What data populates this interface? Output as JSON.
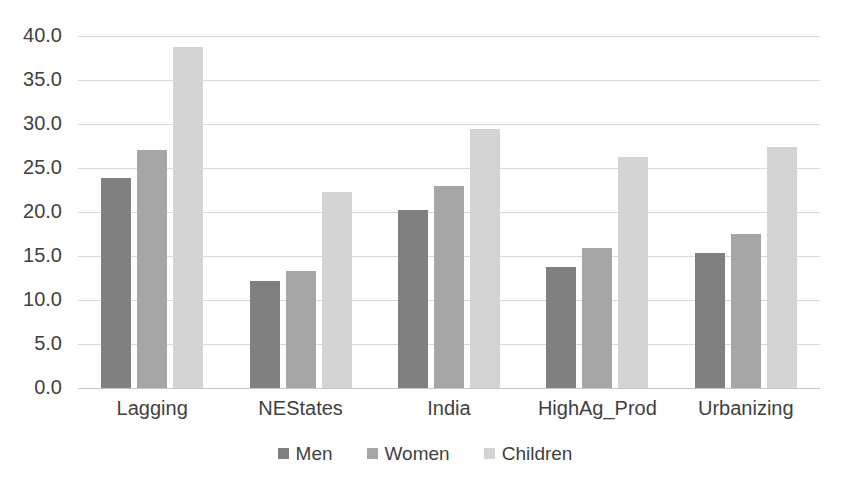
{
  "chart_data": {
    "type": "bar",
    "title": "",
    "subtitle": "",
    "xlabel": "",
    "ylabel": "",
    "categories": [
      "Lagging",
      "NEStates",
      "India",
      "HighAg_Prod",
      "Urbanizing"
    ],
    "series": [
      {
        "name": "Men",
        "color": "#808080",
        "values": [
          23.9,
          12.2,
          20.2,
          13.8,
          15.3
        ]
      },
      {
        "name": "Women",
        "color": "#a6a6a6",
        "values": [
          27.1,
          13.3,
          22.9,
          15.9,
          17.5
        ]
      },
      {
        "name": "Children",
        "color": "#d4d4d4",
        "values": [
          38.8,
          22.3,
          29.4,
          26.2,
          27.4
        ]
      }
    ],
    "ylim": [
      0,
      40
    ],
    "ytick_step": 5,
    "ytick_labels": [
      "0.0",
      "5.0",
      "10.0",
      "15.0",
      "20.0",
      "25.0",
      "30.0",
      "35.0",
      "40.0"
    ],
    "grid": true,
    "grid_axis": "y",
    "legend": [
      "Men",
      "Women",
      "Children"
    ],
    "legend_position": "bottom"
  },
  "axis": {
    "y_ticks": [
      {
        "value": 40,
        "label": "40.0"
      },
      {
        "value": 35,
        "label": "35.0"
      },
      {
        "value": 30,
        "label": "30.0"
      },
      {
        "value": 25,
        "label": "25.0"
      },
      {
        "value": 20,
        "label": "20.0"
      },
      {
        "value": 15,
        "label": "15.0"
      },
      {
        "value": 10,
        "label": "10.0"
      },
      {
        "value": 5,
        "label": "5.0"
      },
      {
        "value": 0,
        "label": "0.0"
      }
    ]
  },
  "groups": [
    {
      "label": "Lagging",
      "men": 23.9,
      "women": 27.1,
      "children": 38.8
    },
    {
      "label": "NEStates",
      "men": 12.2,
      "women": 13.3,
      "children": 22.3
    },
    {
      "label": "India",
      "men": 20.2,
      "women": 22.9,
      "children": 29.4
    },
    {
      "label": "HighAg_Prod",
      "men": 13.8,
      "women": 15.9,
      "children": 26.2
    },
    {
      "label": "Urbanizing",
      "men": 15.3,
      "women": 17.5,
      "children": 27.4
    }
  ],
  "legend": {
    "items": [
      {
        "label": "Men",
        "color": "#808080"
      },
      {
        "label": "Women",
        "color": "#a6a6a6"
      },
      {
        "label": "Children",
        "color": "#d4d4d4"
      }
    ]
  },
  "colors": {
    "men": "#808080",
    "women": "#a6a6a6",
    "children": "#d4d4d4",
    "gridline": "#d9d9d9",
    "text": "#3f3f3f",
    "background": "#ffffff"
  }
}
